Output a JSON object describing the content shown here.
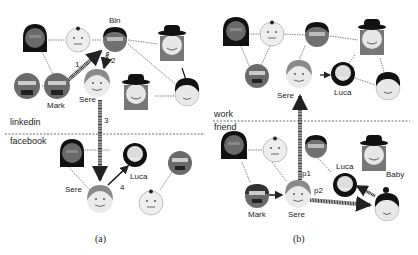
{
  "panels": [
    {
      "id": "a",
      "caption": "(a)",
      "layers": [
        {
          "name": "linkedin",
          "position": "top"
        },
        {
          "name": "facebook",
          "position": "bottom"
        }
      ],
      "node_labels": {
        "bin": "Bin",
        "mark": "Mark",
        "sere_top": "Sere",
        "sere_bottom": "Sere",
        "luca": "Luca"
      },
      "step_labels": {
        "s1": "1",
        "s2": "2",
        "s3": "3",
        "s4": "4"
      }
    },
    {
      "id": "b",
      "caption": "(b)",
      "layers": [
        {
          "name": "work",
          "position": "top"
        },
        {
          "name": "friend",
          "position": "bottom"
        }
      ],
      "node_labels": {
        "sere_top": "Sere",
        "luca_top": "Luca",
        "luca_bottom": "Luca",
        "baby": "Baby",
        "mark": "Mark",
        "sere_bottom": "Sere"
      },
      "path_labels": {
        "p1": "p1",
        "p2": "p2"
      }
    }
  ],
  "colors": {
    "skin": "#e8e8e8",
    "dark_skin": "#6a6a6a",
    "hair": "#1a1a1a",
    "edge": "#555555",
    "arrow": "#333333",
    "divider": "#444444"
  }
}
